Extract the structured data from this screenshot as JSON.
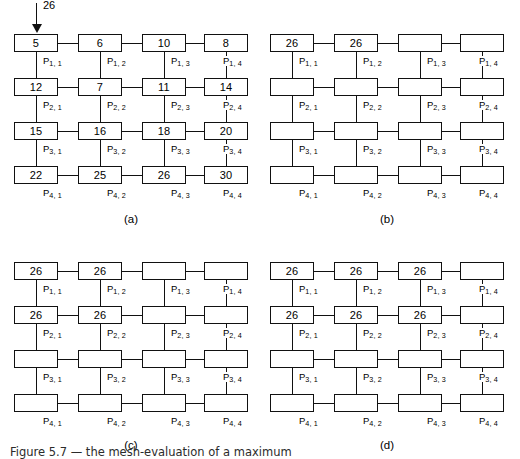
{
  "figure": {
    "caption": "Figure 5.7  — the mesh-evaluation of a maximum",
    "background_color": "#ffffff",
    "line_color": "#111111"
  },
  "grid": {
    "rows": 4,
    "cols": 4,
    "label_prefix": "P",
    "labels": [
      [
        "P1, 1",
        "P1, 2",
        "P1, 3",
        "P1, 4"
      ],
      [
        "P2, 1",
        "P2, 2",
        "P2, 3",
        "P2, 4"
      ],
      [
        "P3, 1",
        "P3, 2",
        "P3, 3",
        "P3, 4"
      ],
      [
        "P4, 1",
        "P4, 2",
        "P4, 3",
        "P4, 4"
      ]
    ],
    "label_subscripts": [
      [
        "1, 1",
        "1, 2",
        "1, 3",
        "1, 4"
      ],
      [
        "2, 1",
        "2, 2",
        "2, 3",
        "2, 4"
      ],
      [
        "3, 1",
        "3, 2",
        "3, 3",
        "3, 4"
      ],
      [
        "4, 1",
        "4, 2",
        "4, 3",
        "4, 4"
      ]
    ]
  },
  "panels": [
    {
      "id": "a",
      "caption": "(a)",
      "arrow": {
        "present": true,
        "value": "26",
        "target_row": 1,
        "target_col": 1
      },
      "values": [
        [
          "5",
          "6",
          "10",
          "8"
        ],
        [
          "12",
          "7",
          "11",
          "14"
        ],
        [
          "15",
          "16",
          "18",
          "20"
        ],
        [
          "22",
          "25",
          "26",
          "30"
        ]
      ]
    },
    {
      "id": "b",
      "caption": "(b)",
      "arrow": {
        "present": false,
        "value": "",
        "target_row": 0,
        "target_col": 0
      },
      "values": [
        [
          "26",
          "26",
          "",
          ""
        ],
        [
          "",
          "",
          "",
          ""
        ],
        [
          "",
          "",
          "",
          ""
        ],
        [
          "",
          "",
          "",
          ""
        ]
      ]
    },
    {
      "id": "c",
      "caption": "(c)",
      "arrow": {
        "present": false,
        "value": "",
        "target_row": 0,
        "target_col": 0
      },
      "values": [
        [
          "26",
          "26",
          "",
          ""
        ],
        [
          "26",
          "26",
          "",
          ""
        ],
        [
          "",
          "",
          "",
          ""
        ],
        [
          "",
          "",
          "",
          ""
        ]
      ]
    },
    {
      "id": "d",
      "caption": "(d)",
      "arrow": {
        "present": false,
        "value": "",
        "target_row": 0,
        "target_col": 0
      },
      "values": [
        [
          "26",
          "26",
          "26",
          ""
        ],
        [
          "26",
          "26",
          "26",
          ""
        ],
        [
          "",
          "",
          "",
          ""
        ],
        [
          "",
          "",
          "",
          ""
        ]
      ]
    }
  ]
}
